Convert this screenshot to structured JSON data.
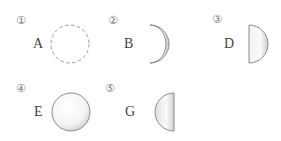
{
  "items": [
    {
      "marker": "①",
      "label": "A",
      "shape": "dashed-circle"
    },
    {
      "marker": "②",
      "label": "B",
      "shape": "waxing-crescent"
    },
    {
      "marker": "③",
      "label": "D",
      "shape": "right-half-moon"
    },
    {
      "marker": "④",
      "label": "E",
      "shape": "full-moon"
    },
    {
      "marker": "⑤",
      "label": "G",
      "shape": "left-half-moon"
    }
  ],
  "colors": {
    "outline": "#8a8a8a",
    "fill_light": "#ffffff",
    "fill_shade": "#d6d6d6",
    "dash": "#9a9a9a"
  }
}
